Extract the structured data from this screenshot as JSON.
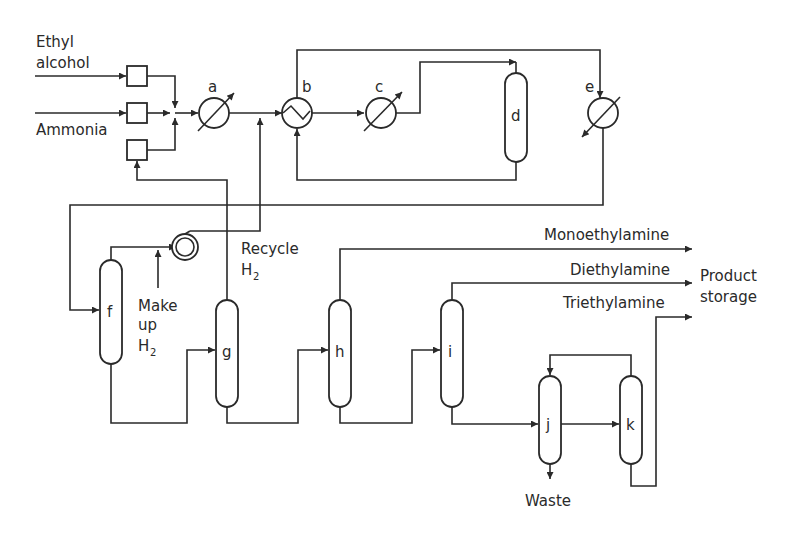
{
  "diagram": {
    "inputs": {
      "ethyl_alcohol_line1": "Ethyl",
      "ethyl_alcohol_line2": "alcohol",
      "ammonia": "Ammonia"
    },
    "equipment": {
      "a": "a",
      "b": "b",
      "c": "c",
      "d": "d",
      "e": "e",
      "f": "f",
      "g": "g",
      "h": "h",
      "i": "i",
      "j": "j",
      "k": "k"
    },
    "labels": {
      "recycle": "Recycle",
      "recycle_h": "H",
      "recycle_sub": "2",
      "makeup_line1": "Make",
      "makeup_line2": "up",
      "makeup_h": "H",
      "makeup_sub": "2",
      "monoethylamine": "Monoethylamine",
      "diethylamine": "Diethylamine",
      "triethylamine": "Triethylamine",
      "product_line1": "Product",
      "product_line2": "storage",
      "waste": "Waste"
    }
  }
}
